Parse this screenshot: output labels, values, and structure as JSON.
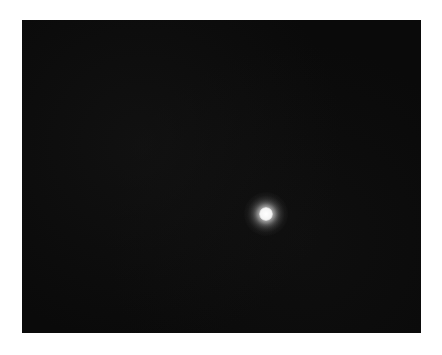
{
  "image": {
    "description": "Dark astronomical-style image with a single bright point source",
    "background_color": "#0a0a0a",
    "page_background": "#ffffff",
    "source": {
      "label": "bright point source",
      "center_x": 266,
      "center_y": 214,
      "color": "#ffffff"
    }
  }
}
